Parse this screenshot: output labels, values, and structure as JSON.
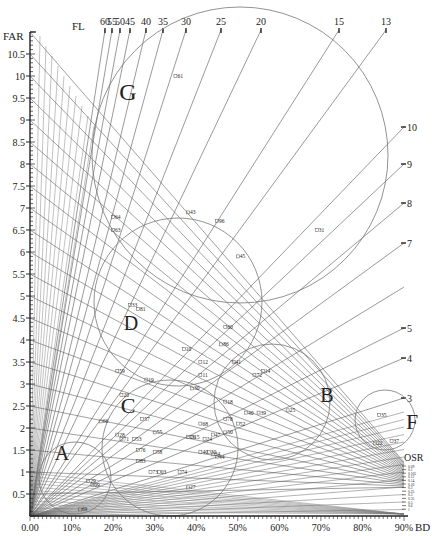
{
  "chart_data": {
    "type": "scatter",
    "title": "",
    "xlabel": "BD",
    "ylabel": "FAR",
    "xlim": [
      0,
      90
    ],
    "ylim": [
      0,
      11
    ],
    "x_ticks": [
      "0.00",
      "10%",
      "20%",
      "30%",
      "40%",
      "50%",
      "60%",
      "70%",
      "80%",
      "90%"
    ],
    "y_ticks": [
      "0.5",
      "1",
      "1.5",
      "2",
      "2.5",
      "3",
      "3.5",
      "4",
      "4.5",
      "5",
      "5.5",
      "6",
      "6.5",
      "7",
      "7.5",
      "8",
      "8.5",
      "9",
      "9.5",
      "10",
      "10.5"
    ],
    "grid": false,
    "isolines": {
      "FL": {
        "label": "FL",
        "values": [
          60,
          55,
          50,
          45,
          40,
          35,
          30,
          25,
          20,
          15,
          13,
          10,
          9,
          8,
          7,
          6,
          5,
          4,
          3
        ],
        "top_labels": [
          "60",
          "55",
          "50",
          "45",
          "40",
          "35",
          "30",
          "25",
          "20",
          "15",
          "13"
        ],
        "right_labels": [
          "10",
          "9",
          "8",
          "7",
          "5",
          "4",
          "3"
        ]
      },
      "OSR": {
        "label": "OSR",
        "values": [
          "0.09",
          "0.1",
          "0.105",
          "0.12",
          "0.14",
          "0.16",
          "0.2",
          "0.25",
          "0.3",
          "0.35",
          "0.5",
          "0.6",
          "1"
        ]
      }
    },
    "clusters": [
      {
        "name": "A",
        "cx": 10,
        "cy": 0.8,
        "r_pct": 8.5
      },
      {
        "name": "B",
        "cx": 60,
        "cy": 2.6,
        "r_pct": 11
      },
      {
        "name": "C",
        "cx": 30,
        "cy": 1.8,
        "r_pct": 18
      },
      {
        "name": "D",
        "cx": 28,
        "cy": 4.9,
        "r_pct": 18
      },
      {
        "name": "F",
        "cx": 86,
        "cy": 2.3,
        "r_pct": 6
      },
      {
        "name": "G",
        "cx": 41,
        "cy": 8.3,
        "r_pct": 28
      }
    ],
    "points": [
      {
        "id": "61",
        "x": 35,
        "y": 10.0
      },
      {
        "id": "64",
        "x": 20,
        "y": 6.8
      },
      {
        "id": "63",
        "x": 20,
        "y": 6.5
      },
      {
        "id": "43",
        "x": 38,
        "y": 6.9
      },
      {
        "id": "96",
        "x": 45,
        "y": 6.7
      },
      {
        "id": "31",
        "x": 69,
        "y": 6.5
      },
      {
        "id": "45",
        "x": 50,
        "y": 5.9
      },
      {
        "id": "33",
        "x": 24,
        "y": 4.8
      },
      {
        "id": "81",
        "x": 26,
        "y": 4.7
      },
      {
        "id": "60",
        "x": 47,
        "y": 4.3
      },
      {
        "id": "86",
        "x": 46,
        "y": 3.9
      },
      {
        "id": "10",
        "x": 37,
        "y": 3.8
      },
      {
        "id": "12",
        "x": 41,
        "y": 3.5
      },
      {
        "id": "41",
        "x": 49,
        "y": 3.5
      },
      {
        "id": "11",
        "x": 41,
        "y": 3.2
      },
      {
        "id": "14",
        "x": 56,
        "y": 3.3
      },
      {
        "id": "72",
        "x": 54,
        "y": 3.2
      },
      {
        "id": "59",
        "x": 21,
        "y": 3.3
      },
      {
        "id": "19",
        "x": 28,
        "y": 3.1
      },
      {
        "id": "30",
        "x": 39,
        "y": 2.9
      },
      {
        "id": "18",
        "x": 47,
        "y": 2.6
      },
      {
        "id": "40",
        "x": 52,
        "y": 2.35
      },
      {
        "id": "39",
        "x": 55,
        "y": 2.35
      },
      {
        "id": "25",
        "x": 62,
        "y": 2.4
      },
      {
        "id": "35",
        "x": 84,
        "y": 2.3
      },
      {
        "id": "37",
        "x": 87,
        "y": 1.7
      },
      {
        "id": "22",
        "x": 83,
        "y": 1.65
      },
      {
        "id": "20",
        "x": 22,
        "y": 2.75
      },
      {
        "id": "57",
        "x": 27,
        "y": 2.2
      },
      {
        "id": "66",
        "x": 17,
        "y": 2.15
      },
      {
        "id": "78",
        "x": 47,
        "y": 2.2
      },
      {
        "id": "52",
        "x": 50,
        "y": 2.1
      },
      {
        "id": "68",
        "x": 41,
        "y": 2.1
      },
      {
        "id": "50",
        "x": 47,
        "y": 1.9
      },
      {
        "id": "47",
        "x": 44,
        "y": 1.85
      },
      {
        "id": "24",
        "x": 42,
        "y": 1.75
      },
      {
        "id": "26",
        "x": 38,
        "y": 1.8
      },
      {
        "id": "15",
        "x": 39,
        "y": 1.8
      },
      {
        "id": "34",
        "x": 44,
        "y": 1.4
      },
      {
        "id": "44",
        "x": 45,
        "y": 1.35
      },
      {
        "id": "40b",
        "x": 41,
        "y": 1.45
      },
      {
        "id": "30b",
        "x": 43,
        "y": 1.45
      },
      {
        "id": "28",
        "x": 21,
        "y": 1.85
      },
      {
        "id": "71",
        "x": 22,
        "y": 1.75
      },
      {
        "id": "53",
        "x": 25,
        "y": 1.75
      },
      {
        "id": "55",
        "x": 30,
        "y": 1.9
      },
      {
        "id": "58",
        "x": 30,
        "y": 1.45
      },
      {
        "id": "76",
        "x": 26,
        "y": 1.5
      },
      {
        "id": "83",
        "x": 26,
        "y": 1.25
      },
      {
        "id": "73",
        "x": 29,
        "y": 1.0
      },
      {
        "id": "03",
        "x": 31,
        "y": 1.0
      },
      {
        "id": "74",
        "x": 36,
        "y": 1.0
      },
      {
        "id": "27",
        "x": 38,
        "y": 0.65
      },
      {
        "id": "29",
        "x": 14,
        "y": 0.8
      },
      {
        "id": "09",
        "x": 15,
        "y": 0.7
      },
      {
        "id": "69",
        "x": 12,
        "y": 0.15
      }
    ]
  },
  "labels": {
    "far": "FAR",
    "fl": "FL",
    "osr": "OSR",
    "bd": "BD"
  }
}
